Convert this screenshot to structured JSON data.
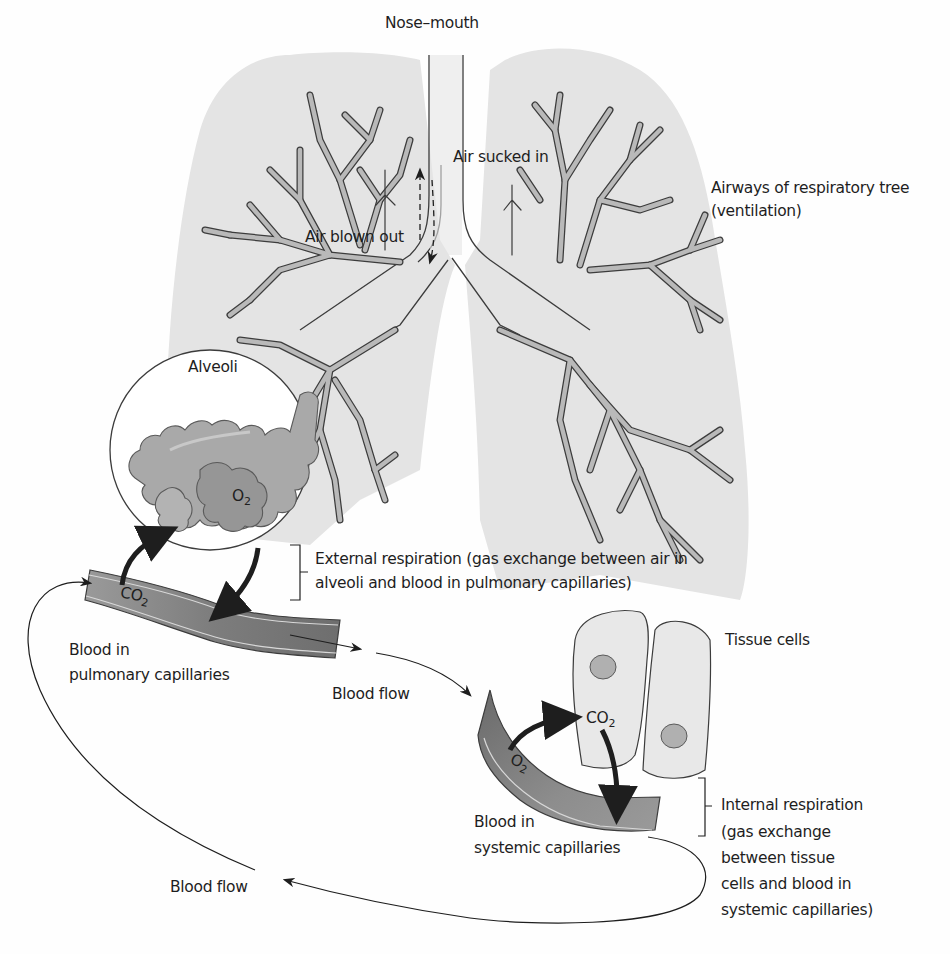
{
  "diagram": {
    "type": "respiratory-system-gas-exchange",
    "colors": {
      "lung_fill": "#e4e4e4",
      "airway_fill": "#b9b9b9",
      "airway_stroke": "#3c3c3c",
      "alveoli_fill": "#a9a9a9",
      "alveoli_dark": "#8f8f8f",
      "capillary_fill": "#8a8a8a",
      "capillary_dark": "#6a6a6a",
      "cell_fill": "#e8e8e8",
      "nucleus_fill": "#b0b0b0",
      "text": "#1e1e1e"
    },
    "labels": {
      "nose_mouth": "Nose–mouth",
      "air_sucked_in": "Air sucked in",
      "air_blown_out": "Air blown out",
      "airways_line1": "Airways of respiratory tree",
      "airways_line2": "(ventilation)",
      "alveoli": "Alveoli",
      "o2_alveoli": "O",
      "co2_pulmonary": "CO",
      "external_line1": "External respiration (gas exchange between air in",
      "external_line2": "alveoli and blood in pulmonary capillaries)",
      "pulmonary_line1": "Blood in",
      "pulmonary_line2": "pulmonary capillaries",
      "blood_flow_top": "Blood flow",
      "tissue_cells": "Tissue cells",
      "co2_tissue": "CO",
      "o2_systemic": "O",
      "systemic_line1": "Blood in",
      "systemic_line2": "systemic capillaries",
      "internal_line1": "Internal respiration",
      "internal_line2": "(gas exchange",
      "internal_line3": "between tissue",
      "internal_line4": "cells and blood in",
      "internal_line5": "systemic capillaries)",
      "blood_flow_bottom": "Blood flow",
      "subscript_2": "2"
    }
  }
}
